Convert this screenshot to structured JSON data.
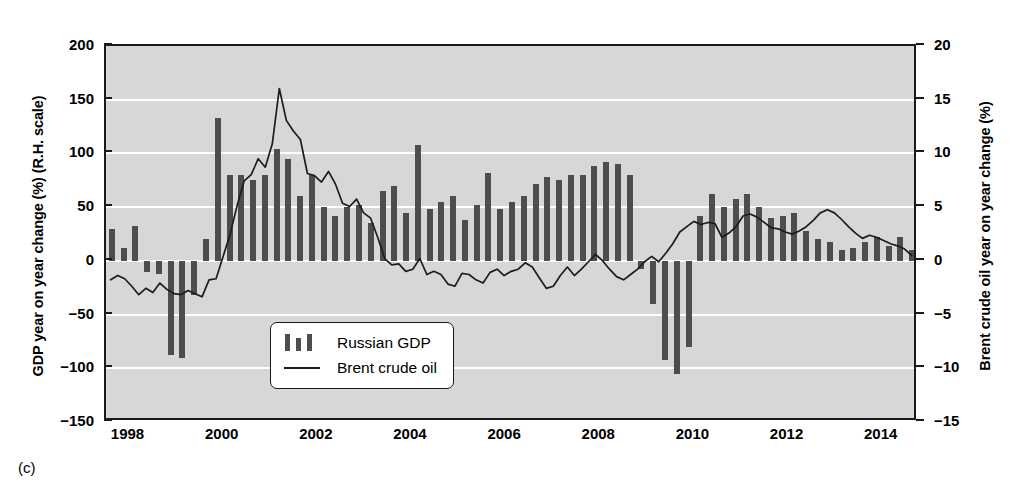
{
  "figure": {
    "caption": "(c)"
  },
  "axes": {
    "left": {
      "title": "GDP year on year change (%) (R.H. scale)",
      "ticks": [
        200,
        150,
        100,
        50,
        0,
        -50,
        -100,
        -150
      ],
      "tick_labels": [
        "200",
        "150",
        "100",
        "50",
        "0",
        "−50",
        "−100",
        "−150"
      ],
      "min": -150,
      "max": 200
    },
    "right": {
      "title": "Brent crude oil year on year change (%)",
      "ticks": [
        20,
        15,
        10,
        5,
        0,
        -5,
        -10,
        -15
      ],
      "tick_labels": [
        "20",
        "15",
        "10",
        "5",
        "0",
        "−5",
        "−10",
        "−15"
      ],
      "min": -15,
      "max": 20
    },
    "x": {
      "ticks": [
        1998,
        2000,
        2002,
        2004,
        2006,
        2008,
        2010,
        2012,
        2014
      ],
      "tick_labels": [
        "1998",
        "2000",
        "2002",
        "2004",
        "2006",
        "2008",
        "2010",
        "2012",
        "2014"
      ],
      "min": 1997.5,
      "max": 2014.75
    }
  },
  "legend": {
    "position": "inside-lower-left",
    "entries": [
      {
        "label": "Russian GDP",
        "key": "bars",
        "color": "#4d4d4d"
      },
      {
        "label": "Brent crude oil",
        "key": "line",
        "color": "#1c1c1c"
      }
    ]
  },
  "colors": {
    "plot_background": "#d7d7d7",
    "gridline": "#ffffff",
    "bar": "#4d4d4d",
    "line": "#1c1c1c",
    "frame": "#1a1a1a",
    "page_background": "#ffffff"
  },
  "chart_data": {
    "type": "bar",
    "title": "",
    "xlabel": "",
    "ylabel": "GDP year on year change (%) (R.H. scale)",
    "y2label": "Brent crude oil year on year change (%)",
    "ylim": [
      -150,
      200
    ],
    "y2lim": [
      -15,
      20
    ],
    "xlim": [
      1997.5,
      2014.75
    ],
    "grid": true,
    "grid_axis": "y",
    "series": [
      {
        "name": "Russian GDP",
        "type": "bar",
        "axis": "left",
        "x": [
          1997.625,
          1997.875,
          1998.125,
          1998.375,
          1998.625,
          1998.875,
          1999.125,
          1999.375,
          1999.625,
          1999.875,
          2000.125,
          2000.375,
          2000.625,
          2000.875,
          2001.125,
          2001.375,
          2001.625,
          2001.875,
          2002.125,
          2002.375,
          2002.625,
          2002.875,
          2003.125,
          2003.375,
          2003.625,
          2003.875,
          2004.125,
          2004.375,
          2004.625,
          2004.875,
          2005.125,
          2005.375,
          2005.625,
          2005.875,
          2006.125,
          2006.375,
          2006.625,
          2006.875,
          2007.125,
          2007.375,
          2007.625,
          2007.875,
          2008.125,
          2008.375,
          2008.625,
          2008.875,
          2009.125,
          2009.375,
          2009.625,
          2009.875,
          2010.125,
          2010.375,
          2010.625,
          2010.875,
          2011.125,
          2011.375,
          2011.625,
          2011.875,
          2012.125,
          2012.375,
          2012.625,
          2012.875,
          2013.125,
          2013.375,
          2013.625,
          2013.875,
          2014.125,
          2014.375,
          2014.625
        ],
        "values": [
          30,
          12,
          32,
          -10,
          -12,
          -88,
          -90,
          -32,
          20,
          133,
          80,
          80,
          75,
          80,
          104,
          95,
          60,
          80,
          50,
          42,
          50,
          52,
          35,
          65,
          70,
          45,
          108,
          48,
          55,
          60,
          38,
          52,
          82,
          48,
          55,
          60,
          72,
          78,
          75,
          80,
          80,
          88,
          92,
          90,
          80,
          -8,
          -40,
          -92,
          -105,
          -80,
          42,
          62,
          50,
          58,
          62,
          50,
          40,
          42,
          45,
          28,
          20,
          18,
          10,
          12,
          18,
          22,
          14,
          22,
          10
        ]
      },
      {
        "name": "Brent crude oil",
        "type": "line",
        "axis": "right",
        "x": [
          1997.6,
          1997.75,
          1997.9,
          1998.05,
          1998.2,
          1998.35,
          1998.5,
          1998.65,
          1998.8,
          1998.95,
          1999.1,
          1999.25,
          1999.4,
          1999.55,
          1999.7,
          1999.85,
          2000.0,
          2000.15,
          2000.3,
          2000.45,
          2000.6,
          2000.75,
          2000.9,
          2001.05,
          2001.2,
          2001.35,
          2001.5,
          2001.65,
          2001.8,
          2001.95,
          2002.1,
          2002.25,
          2002.4,
          2002.55,
          2002.7,
          2002.85,
          2003.0,
          2003.15,
          2003.3,
          2003.45,
          2003.6,
          2003.75,
          2003.9,
          2004.05,
          2004.2,
          2004.35,
          2004.5,
          2004.65,
          2004.8,
          2004.95,
          2005.1,
          2005.25,
          2005.4,
          2005.55,
          2005.7,
          2005.85,
          2006.0,
          2006.15,
          2006.3,
          2006.45,
          2006.6,
          2006.75,
          2006.9,
          2007.05,
          2007.2,
          2007.35,
          2007.5,
          2007.65,
          2007.8,
          2007.95,
          2008.1,
          2008.25,
          2008.4,
          2008.55,
          2008.7,
          2008.85,
          2009.0,
          2009.15,
          2009.3,
          2009.45,
          2009.6,
          2009.75,
          2009.9,
          2010.05,
          2010.2,
          2010.35,
          2010.5,
          2010.65,
          2010.8,
          2010.95,
          2011.1,
          2011.25,
          2011.4,
          2011.55,
          2011.7,
          2011.85,
          2012.0,
          2012.15,
          2012.3,
          2012.45,
          2012.6,
          2012.75,
          2012.9,
          2013.05,
          2013.2,
          2013.35,
          2013.5,
          2013.65,
          2013.8,
          2013.95,
          2014.1,
          2014.25,
          2014.4,
          2014.55,
          2014.7
        ],
        "values": [
          -2.0,
          -1.6,
          -1.9,
          -2.6,
          -3.4,
          -2.8,
          -3.2,
          -2.3,
          -2.9,
          -3.3,
          -3.4,
          -3.0,
          -3.3,
          -3.6,
          -2.0,
          -1.9,
          0.2,
          2.3,
          5.0,
          7.3,
          7.9,
          9.4,
          8.6,
          10.8,
          16.0,
          13.0,
          12.0,
          11.2,
          8.0,
          7.8,
          7.2,
          8.2,
          7.0,
          5.2,
          4.9,
          5.6,
          4.3,
          3.8,
          2.0,
          0.0,
          -0.6,
          -0.5,
          -1.2,
          -1.0,
          0.0,
          -1.5,
          -1.2,
          -1.5,
          -2.4,
          -2.6,
          -1.4,
          -1.5,
          -2.0,
          -2.3,
          -1.3,
          -1.0,
          -1.6,
          -1.2,
          -1.0,
          -0.4,
          -0.8,
          -1.8,
          -2.8,
          -2.6,
          -1.6,
          -0.8,
          -1.6,
          -1.0,
          -0.3,
          0.4,
          -0.2,
          -1.0,
          -1.7,
          -2.0,
          -1.5,
          -1.0,
          -0.3,
          0.2,
          -0.3,
          0.5,
          1.4,
          2.5,
          3.0,
          3.5,
          3.2,
          3.4,
          3.3,
          2.0,
          2.4,
          3.0,
          4.0,
          4.2,
          3.9,
          3.4,
          2.9,
          2.8,
          2.5,
          2.3,
          2.6,
          3.0,
          3.6,
          4.3,
          4.6,
          4.3,
          3.7,
          3.0,
          2.4,
          1.9,
          2.2,
          2.0,
          1.7,
          1.4,
          1.2,
          0.9,
          0.3
        ]
      }
    ]
  }
}
